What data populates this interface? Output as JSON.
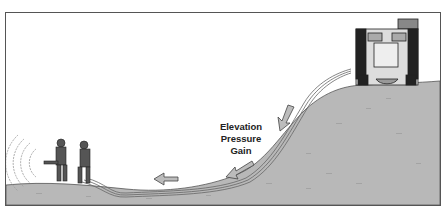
{
  "diagram": {
    "label_lines": [
      "Elevation",
      "Pressure",
      "Gain"
    ],
    "elements": [
      "fire-engine",
      "hose-line",
      "firefighter-nozzle",
      "firefighter-backup",
      "water-spray",
      "flow-arrows",
      "hill"
    ],
    "colors": {
      "ground": "#b8b8b8",
      "ground_speckle": "#a3a3a3",
      "outline": "#333333",
      "arrow_fill": "#bcbcbc"
    }
  }
}
